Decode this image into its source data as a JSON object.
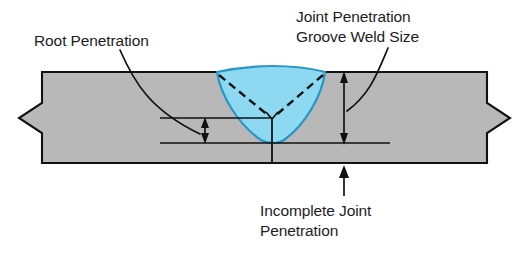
{
  "figure": {
    "title": "Joint Penetration and Root Penetration in a Groove Weld",
    "background_color": "#ffffff"
  },
  "labels": {
    "root_penetration": "Root Penetration",
    "joint_penetration_line1": "Joint Penetration",
    "joint_penetration_line2": "Groove Weld Size",
    "incomplete_line1": "Incomplete Joint",
    "incomplete_line2": "Penetration"
  },
  "colors": {
    "base_metal": "#b8b8b8",
    "base_metal_outline": "#111111",
    "weld_metal": "#8ed9f2",
    "weld_metal_outline": "#2b95c6",
    "annotation": "#1d1d1f",
    "background": "#ffffff"
  },
  "geometry": {
    "plate_top_y": 72,
    "plate_bottom_y": 163,
    "plate_left_x": 42,
    "plate_right_x": 487,
    "weld_center_x": 272,
    "weld_root_y": 118,
    "weld_toe_left_x": 217,
    "weld_toe_right_x": 325,
    "weld_bottom_y": 143,
    "break_symbol_left": true,
    "break_symbol_right": true
  },
  "dimensions": {
    "root_penetration": {
      "name": "root-penetration",
      "type": "double-arrow-vertical",
      "x": 205,
      "y_top": 118,
      "y_bottom": 143,
      "extension_from_x": 160,
      "extension_to_x": 272
    },
    "joint_penetration_groove_weld_size": {
      "name": "joint-penetration-groove-weld-size",
      "type": "double-arrow-vertical",
      "x": 344,
      "y_top": 72,
      "y_bottom": 143,
      "extension_from_x": 272,
      "extension_to_x": 390
    },
    "incomplete_joint_penetration": {
      "name": "incomplete-joint-penetration",
      "type": "single-arrow-up",
      "x": 344,
      "y_tip": 167,
      "y_tail": 196
    }
  },
  "annotation_leaders": [
    {
      "name": "root-penetration-leader",
      "from_text": "Root Penetration",
      "path": "M 120,50 C 134,82 150,110 200,135"
    },
    {
      "name": "joint-penetration-leader",
      "from_text": "Joint Penetration Groove Weld Size",
      "path": "M 388,48 C 378,74 372,92 348,110"
    }
  ]
}
